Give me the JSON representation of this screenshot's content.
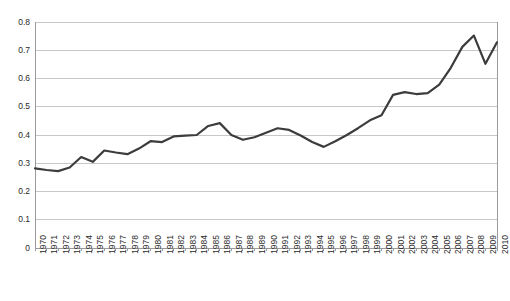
{
  "chart_data": {
    "type": "line",
    "title": "",
    "subtitle": "",
    "xlabel": "",
    "ylabel": "",
    "grid": "horizontal",
    "legend": "none",
    "xlim": [
      1970,
      2010
    ],
    "ylim": [
      0,
      0.8
    ],
    "ytick_labels": [
      "0.8",
      "0.7",
      "0.6",
      "0.5",
      "0.4",
      "0.3",
      "0.2",
      "0.1",
      "0"
    ],
    "ytick_values": [
      0.8,
      0.7,
      0.6,
      0.5,
      0.4,
      0.3,
      0.2,
      0.1,
      0
    ],
    "categories": [
      "1970",
      "1971",
      "1972",
      "1973",
      "1974",
      "1975",
      "1976",
      "1977",
      "1978",
      "1979",
      "1980",
      "1981",
      "1982",
      "1983",
      "1984",
      "1985",
      "1986",
      "1987",
      "1988",
      "1989",
      "1990",
      "1991",
      "1992",
      "1993",
      "1994",
      "1995",
      "1996",
      "1997",
      "1998",
      "1999",
      "2000",
      "2001",
      "2002",
      "2003",
      "2004",
      "2005",
      "2006",
      "2007",
      "2008",
      "2009",
      "2010"
    ],
    "series": [
      {
        "name": "series-1",
        "color": "#3c3c3c",
        "values": [
          0.282,
          0.276,
          0.272,
          0.285,
          0.322,
          0.305,
          0.345,
          0.338,
          0.332,
          0.352,
          0.378,
          0.375,
          0.395,
          0.398,
          0.4,
          0.432,
          0.442,
          0.4,
          0.383,
          0.392,
          0.408,
          0.424,
          0.418,
          0.398,
          0.375,
          0.358,
          0.378,
          0.4,
          0.425,
          0.452,
          0.47,
          0.542,
          0.552,
          0.545,
          0.548,
          0.578,
          0.638,
          0.712,
          0.752,
          0.652,
          0.728
        ]
      }
    ]
  },
  "style": {
    "background": "#ffffff",
    "grid_color": "#c8c8c8",
    "axis_color": "#9a9a9a",
    "tick_text_color": "#2b2b2b",
    "line_color": "#3c3c3c",
    "line_width": 2.2
  },
  "plot_geometry": {
    "left": 35,
    "right": 497,
    "top": 22,
    "bottom": 248
  }
}
